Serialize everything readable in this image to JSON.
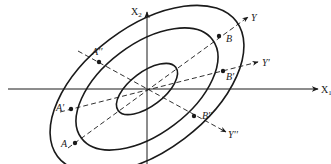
{
  "diagram": {
    "type": "concentric rotated ellipses with principal axes",
    "colors": {
      "stroke": "#1a1a1a",
      "background": "#ffffff"
    },
    "axes": {
      "x1": {
        "label": "X",
        "subscript": "1"
      },
      "x2": {
        "label": "X",
        "subscript": "2"
      }
    },
    "dashed_axes": [
      {
        "id": "Y",
        "label": "Y"
      },
      {
        "id": "Yp",
        "label": "Y′"
      },
      {
        "id": "Ypp",
        "label": "Y′′"
      }
    ],
    "ellipses": [
      {
        "id": "inner",
        "rx": 36,
        "ry": 17
      },
      {
        "id": "middle",
        "rx": 82,
        "ry": 45
      },
      {
        "id": "outer",
        "rx": 112,
        "ry": 62
      }
    ],
    "points": [
      {
        "id": "A",
        "label": "A"
      },
      {
        "id": "B",
        "label": "B"
      },
      {
        "id": "Ap",
        "label": "A′"
      },
      {
        "id": "Bp",
        "label": "B′"
      },
      {
        "id": "App",
        "label": "A′′"
      },
      {
        "id": "Bpp",
        "label": "B′′"
      }
    ]
  }
}
